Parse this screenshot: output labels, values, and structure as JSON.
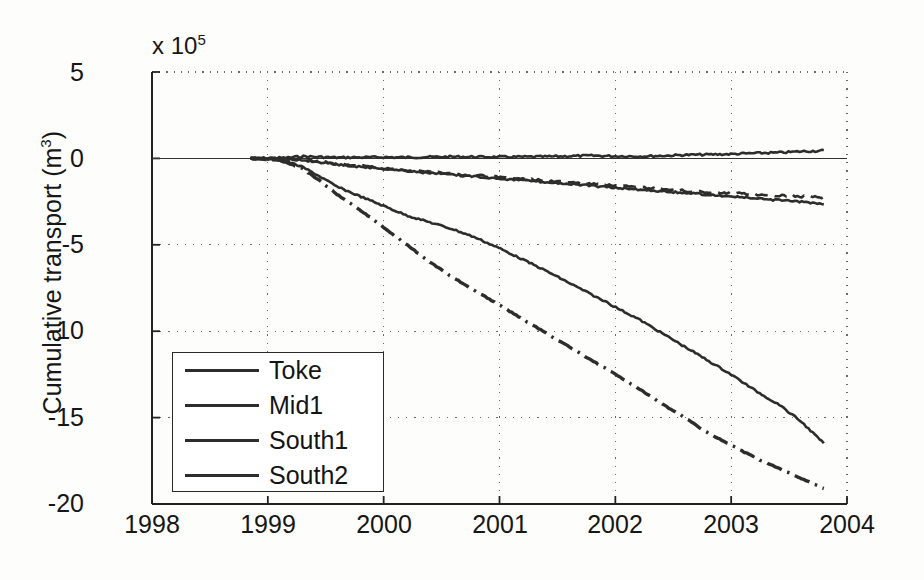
{
  "figure": {
    "title": "",
    "y_axis_label": "Cumulative transport (m",
    "y_axis_label_sup": "3",
    "y_axis_label_close": ")",
    "exponent_prefix": "x 10",
    "exponent_power": "5"
  },
  "legend": {
    "items": [
      {
        "label": "Toke",
        "style": "solid"
      },
      {
        "label": "Mid1",
        "style": "dashed"
      },
      {
        "label": "South1",
        "style": "solid"
      },
      {
        "label": "South2",
        "style": "dashdot"
      }
    ]
  },
  "chart_data": {
    "type": "line",
    "title": "",
    "xlabel": "",
    "ylabel": "Cumulative transport (m^3)",
    "y_multiplier": 100000,
    "y_multiplier_text": "x 10^5",
    "xlim": [
      1998,
      2004
    ],
    "ylim": [
      -20,
      5
    ],
    "xticks": [
      1998,
      1999,
      2000,
      2001,
      2002,
      2003,
      2004
    ],
    "yticks": [
      5,
      0,
      -5,
      -10,
      -15,
      -20
    ],
    "grid": true,
    "grid_style": "dotted",
    "legend_position": "lower left",
    "x": [
      1998.85,
      1999.0,
      1999.15,
      1999.3,
      1999.45,
      1999.6,
      1999.8,
      2000.0,
      2000.2,
      2000.4,
      2000.6,
      2000.8,
      2001.0,
      2001.2,
      2001.4,
      2001.6,
      2001.8,
      2002.0,
      2002.2,
      2002.4,
      2002.6,
      2002.8,
      2003.0,
      2003.2,
      2003.4,
      2003.6,
      2003.8
    ],
    "series": [
      {
        "name": "Toke",
        "style": "solid",
        "color": "#2d2d2d",
        "values": [
          0.0,
          0.02,
          0.03,
          0.12,
          0.08,
          0.05,
          0.06,
          0.07,
          0.06,
          0.08,
          0.1,
          0.09,
          0.08,
          0.09,
          0.1,
          0.13,
          0.16,
          0.13,
          0.12,
          0.15,
          0.2,
          0.22,
          0.25,
          0.3,
          0.33,
          0.4,
          0.45
        ]
      },
      {
        "name": "Mid1",
        "style": "dashed",
        "color": "#2d2d2d",
        "values": [
          0.0,
          -0.01,
          -0.02,
          -0.08,
          -0.18,
          -0.3,
          -0.42,
          -0.55,
          -0.68,
          -0.78,
          -0.88,
          -0.98,
          -1.08,
          -1.18,
          -1.28,
          -1.38,
          -1.48,
          -1.58,
          -1.68,
          -1.78,
          -1.88,
          -1.96,
          -2.02,
          -2.08,
          -2.14,
          -2.2,
          -2.25
        ]
      },
      {
        "name": "South1",
        "style": "solid",
        "color": "#2d2d2d",
        "values": [
          0.0,
          -0.01,
          -0.03,
          -0.1,
          -0.22,
          -0.35,
          -0.48,
          -0.6,
          -0.72,
          -0.84,
          -0.95,
          -1.06,
          -1.16,
          -1.26,
          -1.37,
          -1.48,
          -1.59,
          -1.7,
          -1.8,
          -1.9,
          -2.0,
          -2.1,
          -2.2,
          -2.32,
          -2.42,
          -2.52,
          -2.62
        ]
      },
      {
        "name": "South2",
        "style": "dashdot",
        "color": "#2d2d2d",
        "values": [
          0.0,
          -0.05,
          -0.2,
          -0.6,
          -1.3,
          -2.1,
          -3.0,
          -4.0,
          -5.0,
          -6.0,
          -6.9,
          -7.7,
          -8.5,
          -9.3,
          -10.1,
          -10.9,
          -11.7,
          -12.5,
          -13.3,
          -14.2,
          -15.0,
          -15.9,
          -16.6,
          -17.3,
          -17.9,
          -18.5,
          -19.1
        ]
      },
      {
        "name": "South1-steep",
        "style": "solid",
        "color": "#2d2d2d",
        "values": [
          0.0,
          -0.03,
          -0.15,
          -0.5,
          -1.05,
          -1.65,
          -2.2,
          -2.75,
          -3.3,
          -3.7,
          -4.1,
          -4.6,
          -5.2,
          -5.85,
          -6.5,
          -7.2,
          -7.9,
          -8.6,
          -9.3,
          -10.1,
          -10.9,
          -11.7,
          -12.5,
          -13.4,
          -14.2,
          -15.2,
          -16.5
        ]
      }
    ]
  }
}
